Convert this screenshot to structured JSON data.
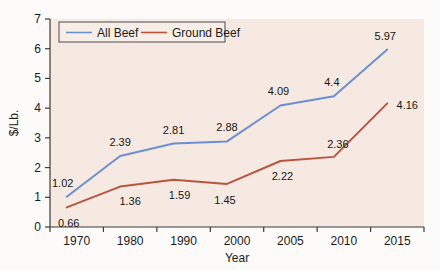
{
  "chart_data": {
    "type": "line",
    "title": "",
    "xlabel": "Year",
    "ylabel": "$/Lb.",
    "categories": [
      "1970",
      "1980",
      "1990",
      "2000",
      "2005",
      "2010",
      "2015"
    ],
    "ylim": [
      0,
      7
    ],
    "yticks": [
      "0",
      "1",
      "2",
      "3",
      "4",
      "5",
      "6",
      "7"
    ],
    "grid": false,
    "legend_position": "top-left",
    "series": [
      {
        "name": "All Beef",
        "color": "#6b8fd4",
        "values": [
          1.02,
          2.39,
          2.81,
          2.88,
          4.09,
          4.4,
          5.97
        ],
        "labels": [
          "1.02",
          "2.39",
          "2.81",
          "2.88",
          "4.09",
          "4.4",
          "5.97"
        ]
      },
      {
        "name": "Ground Beef",
        "color": "#b9543f",
        "values": [
          0.66,
          1.36,
          1.59,
          1.45,
          2.22,
          2.36,
          4.16
        ],
        "labels": [
          "0.66",
          "1.36",
          "1.59",
          "1.45",
          "2.22",
          "2.36",
          "4.16"
        ]
      }
    ]
  },
  "colors": {
    "plot_background": "#f6e9e1",
    "page_background": "#fdfbfa",
    "axis": "#3a3a3a",
    "series_all_beef": "#6b8fd4",
    "series_ground_beef": "#b9543f",
    "legend_border": "#4d4d4d",
    "legend_background": "#f8eee8"
  }
}
